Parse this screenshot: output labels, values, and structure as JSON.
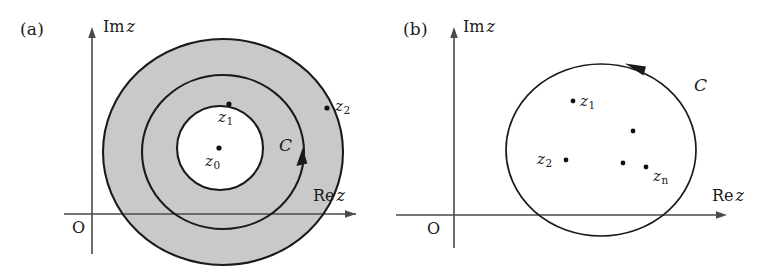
{
  "figure": {
    "type": "complex-plane-contour-diagram",
    "width": 777,
    "height": 278,
    "background": "#ffffff",
    "stroke_color": "#1a1a1a",
    "axis_color": "#4a4a4a",
    "annulus_fill": "#c9c9c9"
  },
  "panel_a": {
    "tag": "(a)",
    "axes": {
      "imaginary_label_prefix": "Im",
      "imaginary_label_var": "z",
      "real_label_prefix": "Re",
      "real_label_var": "z",
      "origin_label": "O"
    },
    "circles": [
      {
        "name": "outer-circle",
        "cx": 223,
        "cy": 152,
        "r": 120,
        "ry": 113,
        "role": "annulus-outer-boundary"
      },
      {
        "name": "contour-circle",
        "cx": 223,
        "cy": 152,
        "r": 81,
        "ry": 77,
        "role": "integration-contour"
      },
      {
        "name": "inner-circle",
        "cx": 220,
        "cy": 148,
        "r": 43,
        "ry": 42,
        "role": "annulus-inner-boundary"
      }
    ],
    "shaded_region": "annulus between inner and outer circle",
    "points": [
      {
        "name": "z0",
        "label": "z",
        "sub": "0",
        "x": 219,
        "y": 148,
        "label_x": 205,
        "label_y": 154
      },
      {
        "name": "z1",
        "label": "z",
        "sub": "1",
        "x": 229,
        "y": 104,
        "label_x": 218,
        "label_y": 110
      },
      {
        "name": "z2",
        "label": "z",
        "sub": "2",
        "x": 327,
        "y": 108,
        "label_x": 335,
        "label_y": 98
      }
    ],
    "contour_label": "C",
    "contour_label_x": 279,
    "contour_label_y": 138,
    "contour_direction": "counterclockwise"
  },
  "panel_b": {
    "tag": "(b)",
    "axes": {
      "imaginary_label_prefix": "Im",
      "imaginary_label_var": "z",
      "real_label_prefix": "Re",
      "real_label_var": "z",
      "origin_label": "O"
    },
    "circles": [
      {
        "name": "contour-circle",
        "cx": 601,
        "cy": 150,
        "r": 95,
        "ry": 86,
        "role": "integration-contour"
      }
    ],
    "points": [
      {
        "name": "z1",
        "label": "z",
        "sub": "1",
        "x": 573,
        "y": 101,
        "label_x": 580,
        "label_y": 94
      },
      {
        "name": "unlabeled-pole-1",
        "label": "",
        "sub": "",
        "x": 633,
        "y": 131
      },
      {
        "name": "z2",
        "label": "z",
        "sub": "2",
        "x": 566,
        "y": 160,
        "label_x": 537,
        "label_y": 153
      },
      {
        "name": "unlabeled-pole-2",
        "label": "",
        "sub": "",
        "x": 623,
        "y": 163
      },
      {
        "name": "zn",
        "label": "z",
        "sub": "n",
        "x": 646,
        "y": 167,
        "label_x": 653,
        "label_y": 170
      }
    ],
    "contour_label": "C",
    "contour_label_x": 694,
    "contour_label_y": 78,
    "contour_direction": "counterclockwise"
  }
}
